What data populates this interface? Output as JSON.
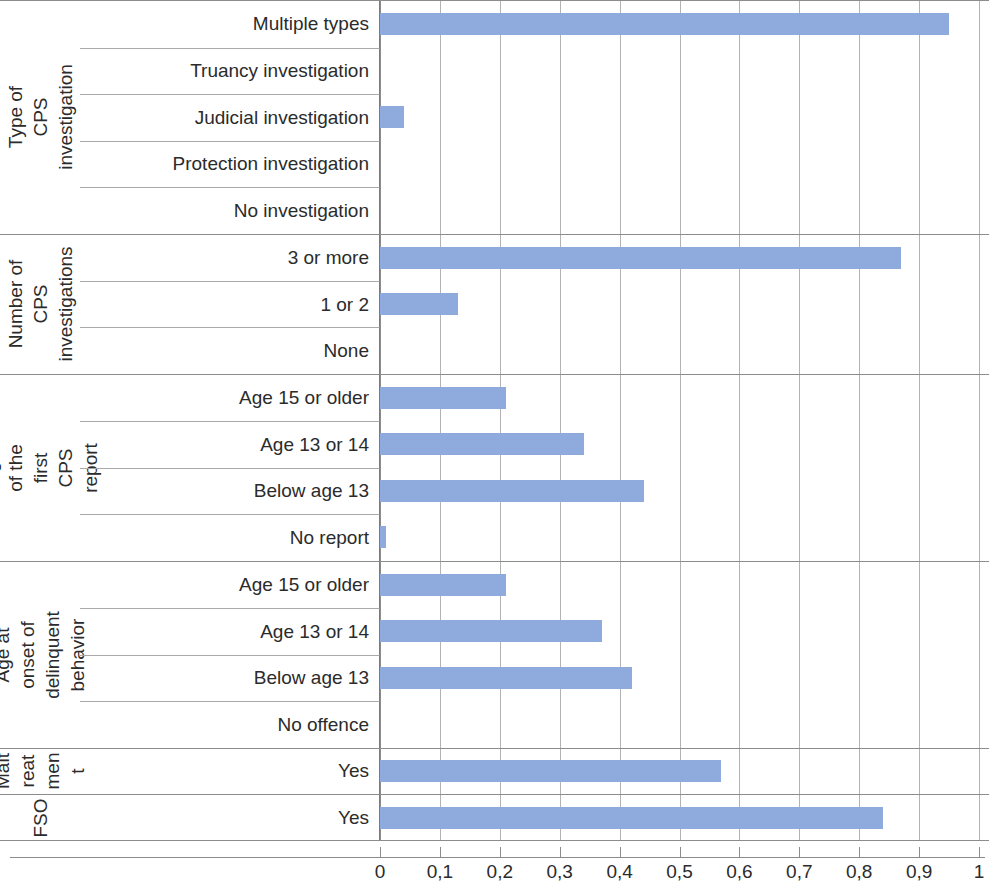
{
  "chart_data": {
    "type": "bar",
    "orientation": "horizontal",
    "title": "",
    "subtitle": "",
    "xlabel": "",
    "ylabel": "",
    "xlim": [
      0,
      1
    ],
    "xticks": [
      0,
      0.1,
      0.2,
      0.3,
      0.4,
      0.5,
      0.6,
      0.7,
      0.8,
      0.9,
      1
    ],
    "xtick_labels": [
      "0",
      "0,1",
      "0,2",
      "0,3",
      "0,4",
      "0,5",
      "0,6",
      "0,7",
      "0,8",
      "0,9",
      "1"
    ],
    "decimal_separator": ",",
    "grid": "vertical",
    "legend": "none",
    "bar_color": "#8faadc",
    "groups": [
      {
        "label": "Type of CPS investigation",
        "label_lines": [
          "Type of CPS",
          "investigation"
        ],
        "categories": [
          "Multiple types",
          "Truancy investigation",
          "Judicial investigation",
          "Protection investigation",
          "No investigation"
        ],
        "values": [
          0.95,
          0.0,
          0.04,
          0.0,
          0.0
        ]
      },
      {
        "label": "Number of CPS investigations",
        "label_lines": [
          "Number of",
          "CPS",
          "investigations"
        ],
        "categories": [
          "3 or more",
          "1 or 2",
          "None"
        ],
        "values": [
          0.87,
          0.13,
          0.0
        ]
      },
      {
        "label": "Age of the first CPS report",
        "label_lines": [
          "Age of the first CPS",
          "report"
        ],
        "categories": [
          "Age 15 or older",
          "Age 13 or 14",
          "Below age 13",
          "No report"
        ],
        "values": [
          0.21,
          0.34,
          0.44,
          0.01
        ]
      },
      {
        "label": "Age at onset of delinquent behavior",
        "label_lines": [
          "Age at onset of",
          "delinquent",
          "behavior"
        ],
        "categories": [
          "Age 15 or older",
          "Age 13 or 14",
          "Below age 13",
          "No offence"
        ],
        "values": [
          0.21,
          0.37,
          0.42,
          0.0
        ]
      },
      {
        "label": "Maltreatment",
        "label_lines": [
          "Malt",
          "reat",
          "men",
          "t"
        ],
        "categories": [
          "Yes"
        ],
        "values": [
          0.57
        ]
      },
      {
        "label": "FSO",
        "label_lines": [
          "FSO"
        ],
        "categories": [
          "Yes"
        ],
        "values": [
          0.84
        ]
      }
    ],
    "categories": [
      "Multiple types",
      "Truancy investigation",
      "Judicial investigation",
      "Protection investigation",
      "No investigation",
      "3 or more",
      "1 or 2",
      "None",
      "Age 15 or older",
      "Age 13 or 14",
      "Below age 13",
      "No report",
      "Age 15 or older",
      "Age 13 or 14",
      "Below age 13",
      "No offence",
      "Yes",
      "Yes"
    ],
    "values": [
      0.95,
      0.0,
      0.04,
      0.0,
      0.0,
      0.87,
      0.13,
      0.0,
      0.21,
      0.34,
      0.44,
      0.01,
      0.21,
      0.37,
      0.42,
      0.0,
      0.57,
      0.84
    ]
  }
}
